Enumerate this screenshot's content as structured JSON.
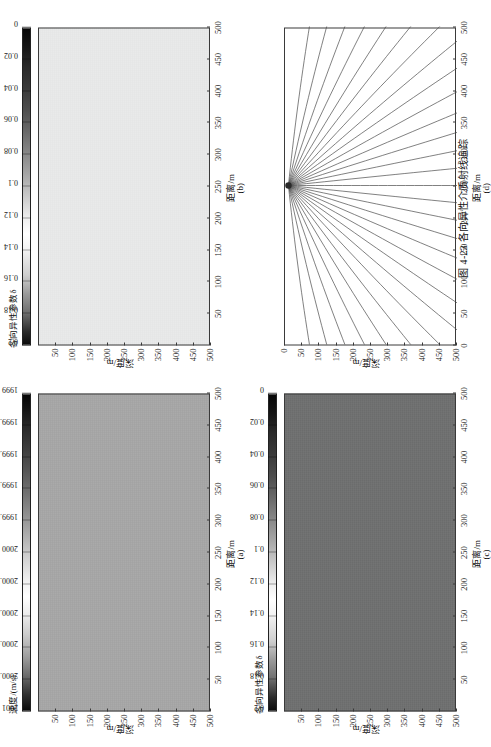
{
  "caption": "图 4-23   各向异性介质射线追踪",
  "axis": {
    "x_label": "距离/m",
    "y_label": "深度/m",
    "x_ticks": [
      "50",
      "100",
      "150",
      "200",
      "250",
      "300",
      "350",
      "400",
      "450",
      "500"
    ],
    "y_ticks": [
      "50",
      "100",
      "150",
      "200",
      "250",
      "300",
      "350",
      "400",
      "450",
      "500"
    ],
    "x_ticks_d": [
      "0",
      "50",
      "100",
      "150",
      "200",
      "250",
      "300",
      "350",
      "400",
      "450",
      "500"
    ],
    "y_ticks_d": [
      "0",
      "50",
      "100",
      "150",
      "200",
      "250",
      "300",
      "350",
      "400",
      "450",
      "500"
    ]
  },
  "panels": [
    {
      "tag": "(a)",
      "kind": "velocity-field",
      "fill": "#a8a8a8",
      "colorbar": {
        "title": "速度/(m/s)",
        "ticks": [
          "2001",
          "2000.8",
          "2000.6",
          "2000.4",
          "2000.2",
          "2000",
          "1999.8",
          "1999.6",
          "1999.4",
          "1999.2",
          "1999"
        ]
      }
    },
    {
      "tag": "(b)",
      "kind": "anisotropy-field-light",
      "fill": "#e9eaea",
      "colorbar": {
        "title": "各向异性参数δ",
        "ticks": [
          "0.2",
          "0.18",
          "0.16",
          "0.14",
          "0.12",
          "0.1",
          "0.08",
          "0.06",
          "0.04",
          "0.02",
          "0"
        ]
      }
    },
    {
      "tag": "(c)",
      "kind": "anisotropy-field-dark",
      "fill": "#6f7070",
      "colorbar": {
        "title": "各向异性参数δ",
        "ticks": [
          "0.2",
          "0.18",
          "0.16",
          "0.14",
          "0.12",
          "0.1",
          "0.08",
          "0.06",
          "0.04",
          "0.02",
          "0"
        ]
      }
    },
    {
      "tag": "(d)",
      "kind": "raypaths",
      "source": {
        "x": 250,
        "y": 10
      },
      "ray_count": 31
    }
  ],
  "chart_data": {
    "type": "line",
    "title": "各向异性介质射线追踪",
    "xlabel": "距离/m",
    "ylabel": "深度/m",
    "xlim": [
      0,
      500
    ],
    "ylim": [
      0,
      500
    ],
    "grid": false,
    "legend": "none",
    "source_point": [
      250,
      10
    ],
    "ray_fan_angles_deg": [
      -84,
      -78,
      -72,
      -66,
      -60,
      -54,
      -48,
      -42,
      -36,
      -30,
      -24,
      -18,
      -12,
      -6,
      0,
      6,
      12,
      18,
      24,
      30,
      36,
      42,
      48,
      54,
      60,
      66,
      72,
      78,
      84
    ],
    "colorbars": [
      {
        "panel": "(a)",
        "label": "速度/(m/s)",
        "min": 1999,
        "max": 2001,
        "ticks": [
          2001,
          2000.8,
          2000.6,
          2000.4,
          2000.2,
          2000,
          1999.8,
          1999.6,
          1999.4,
          1999.2,
          1999
        ]
      },
      {
        "panel": "(b)",
        "label": "各向异性参数δ",
        "min": 0,
        "max": 0.2,
        "ticks": [
          0.2,
          0.18,
          0.16,
          0.14,
          0.12,
          0.1,
          0.08,
          0.06,
          0.04,
          0.02,
          0
        ]
      },
      {
        "panel": "(c)",
        "label": "各向异性参数δ",
        "min": 0,
        "max": 0.2,
        "ticks": [
          0.2,
          0.18,
          0.16,
          0.14,
          0.12,
          0.1,
          0.08,
          0.06,
          0.04,
          0.02,
          0
        ]
      }
    ]
  }
}
